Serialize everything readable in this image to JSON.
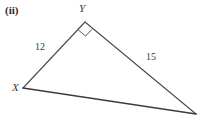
{
  "figure": {
    "part_label": "(ii)",
    "type": "right-triangle-diagram",
    "background_color": "#ffffff",
    "stroke_color": "#4a4a4a",
    "vertices": [
      {
        "name": "Y",
        "label": "Y",
        "x": 85,
        "y": 22
      },
      {
        "name": "X",
        "label": "X",
        "x": 23,
        "y": 88
      },
      {
        "name": "Z",
        "label": "",
        "x": 196,
        "y": 114
      }
    ],
    "sides": [
      {
        "name": "XY",
        "label": "12",
        "from": "X",
        "to": "Y"
      },
      {
        "name": "YZ",
        "label": "15",
        "from": "Y",
        "to": "Z"
      },
      {
        "name": "XZ",
        "label": "",
        "from": "X",
        "to": "Z"
      }
    ],
    "angle_markers": [
      {
        "at": "Y",
        "type": "right-angle-square",
        "label": ""
      }
    ]
  }
}
